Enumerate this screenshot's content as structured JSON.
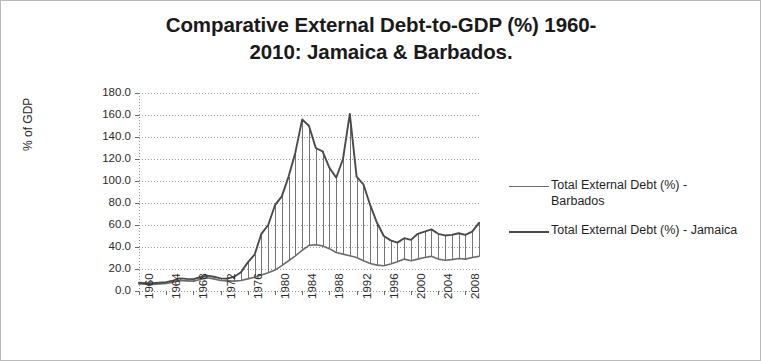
{
  "chart_data": {
    "type": "line",
    "title_line1": "Comparative External Debt-to-GDP (%) 1960-",
    "title_line2": "2010: Jamaica & Barbados.",
    "xlabel": "",
    "ylabel": "% of GDP",
    "ylim": [
      0,
      180
    ],
    "ytick_step": 20,
    "yticks": [
      "180.0",
      "160.0",
      "140.0",
      "120.0",
      "100.0",
      "80.0",
      "60.0",
      "40.0",
      "20.0",
      "0.0"
    ],
    "ytick_values": [
      180,
      160,
      140,
      120,
      100,
      80,
      60,
      40,
      20,
      0
    ],
    "xlim": [
      1960,
      2010
    ],
    "xticks": [
      "1960",
      "1964",
      "1968",
      "1972",
      "1976",
      "1980",
      "1984",
      "1988",
      "1992",
      "1996",
      "2000",
      "2004",
      "2008"
    ],
    "xtick_values": [
      1960,
      1964,
      1968,
      1972,
      1976,
      1980,
      1984,
      1988,
      1992,
      1996,
      2000,
      2004,
      2008
    ],
    "x": [
      1960,
      1961,
      1962,
      1963,
      1964,
      1965,
      1966,
      1967,
      1968,
      1969,
      1970,
      1971,
      1972,
      1973,
      1974,
      1975,
      1976,
      1977,
      1978,
      1979,
      1980,
      1981,
      1982,
      1983,
      1984,
      1985,
      1986,
      1987,
      1988,
      1989,
      1990,
      1991,
      1992,
      1993,
      1994,
      1995,
      1996,
      1997,
      1998,
      1999,
      2000,
      2001,
      2002,
      2003,
      2004,
      2005,
      2006,
      2007,
      2008,
      2009,
      2010
    ],
    "grid": true,
    "grid_axis": "y",
    "legend_position": "right",
    "drop_lines": true,
    "series": [
      {
        "name": "Total External Debt (%) - Barbados",
        "label_line1": "Total External Debt (%) -",
        "label_line2": "Barbados",
        "color": "#6d6d6d",
        "values": [
          6.5,
          6.2,
          6.0,
          6.4,
          6.8,
          8.0,
          9.5,
          9.2,
          9.0,
          10.5,
          12.0,
          11.0,
          9.5,
          9.2,
          9.0,
          9.5,
          11.0,
          12.5,
          14.5,
          16.5,
          19.0,
          23.0,
          27.5,
          32.0,
          37.0,
          41.5,
          42.0,
          41.0,
          38.5,
          35.0,
          33.5,
          32.0,
          30.5,
          27.5,
          25.0,
          23.5,
          23.0,
          24.5,
          26.5,
          29.0,
          27.5,
          29.0,
          30.5,
          31.5,
          29.0,
          28.0,
          28.5,
          29.5,
          29.0,
          30.5,
          31.5
        ]
      },
      {
        "name": "Total External Debt (%) - Jamaica",
        "label_line1": "Total External Debt (%) -",
        "label_line2": "Jamaica",
        "color": "#4a4a4a",
        "values": [
          7.5,
          7.2,
          7.0,
          7.5,
          8.0,
          9.5,
          11.5,
          11.0,
          10.8,
          12.5,
          14.0,
          13.0,
          11.5,
          11.2,
          13.0,
          17.0,
          26.0,
          33.0,
          52.0,
          60.0,
          78.0,
          86.0,
          104.0,
          126.0,
          156.0,
          150.0,
          130.0,
          127.0,
          112.0,
          103.0,
          120.0,
          161.0,
          104.0,
          97.0,
          78.0,
          62.0,
          50.0,
          46.0,
          44.0,
          48.0,
          46.5,
          52.0,
          54.0,
          56.0,
          52.0,
          50.5,
          51.0,
          52.5,
          51.0,
          54.0,
          62.0
        ]
      }
    ]
  }
}
